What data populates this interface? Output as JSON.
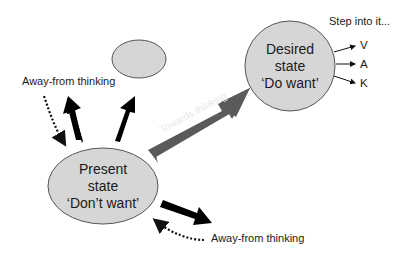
{
  "nodes": {
    "present": {
      "line1": "Present",
      "line2": "state",
      "line3": "‘Don’t want’"
    },
    "desired": {
      "line1": "Desired",
      "line2": "state",
      "line3": "‘Do want’"
    },
    "small_oval": {
      "label": ""
    }
  },
  "labels": {
    "away_top": "Away-from thinking",
    "away_bottom": "Away-from thinking",
    "towards": "Towards thinking",
    "step_into": "Step into it..."
  },
  "vak": [
    "V",
    "A",
    "K"
  ],
  "colors": {
    "node_fill": "#d6d6d6",
    "node_stroke": "#555555",
    "arrow_black": "#000000",
    "towards_arrow": "#5a5a5a",
    "towards_text": "#e8e8e8"
  }
}
